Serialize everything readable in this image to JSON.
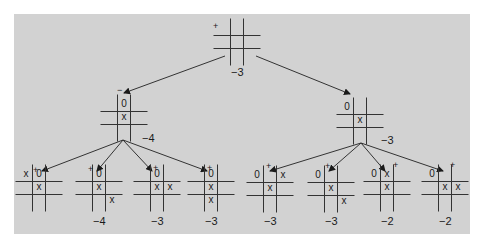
{
  "diagram": {
    "type": "game-tree",
    "title": "",
    "colors": {
      "panel": "#d2d2d2",
      "ink": "#1a1a1a",
      "background": "#ffffff"
    },
    "root": {
      "sign": "+",
      "value": "−3",
      "board": [
        "",
        "",
        "",
        "",
        "",
        "",
        "",
        "",
        ""
      ]
    },
    "level1": [
      {
        "sign": "−",
        "value": "−4",
        "board": [
          "",
          "0",
          "",
          "",
          "x",
          "",
          "",
          "",
          ""
        ]
      },
      {
        "sign": "−",
        "value": "−3",
        "board": [
          "0",
          "",
          "",
          "",
          "x",
          "",
          "",
          "",
          ""
        ]
      }
    ],
    "leaves": [
      {
        "sign": "+",
        "value": "",
        "board": [
          "x",
          "0",
          "",
          "",
          "x",
          "",
          "",
          "",
          ""
        ]
      },
      {
        "sign": "+",
        "value": "−4",
        "board": [
          "",
          "0",
          "",
          "",
          "x",
          "",
          "",
          "",
          "x"
        ]
      },
      {
        "sign": "+",
        "value": "−3",
        "board": [
          "",
          "0",
          "",
          "",
          "x",
          "x",
          "",
          "",
          ""
        ]
      },
      {
        "sign": "+",
        "value": "−3",
        "board": [
          "",
          "0",
          "",
          "",
          "x",
          "",
          "",
          "x",
          ""
        ]
      },
      {
        "sign": "+",
        "value": "−3",
        "board": [
          "0",
          "",
          "x",
          "",
          "x",
          "",
          "",
          "",
          ""
        ]
      },
      {
        "sign": "+",
        "value": "−3",
        "board": [
          "0",
          "",
          "",
          "",
          "x",
          "",
          "",
          "",
          "x"
        ]
      },
      {
        "sign": "+",
        "value": "−2",
        "board": [
          "0",
          "x",
          "",
          "",
          "x",
          "",
          "",
          "",
          ""
        ]
      },
      {
        "sign": "+",
        "value": "−2",
        "board": [
          "0",
          "",
          "",
          "",
          "x",
          "x",
          "",
          "",
          ""
        ]
      }
    ]
  }
}
